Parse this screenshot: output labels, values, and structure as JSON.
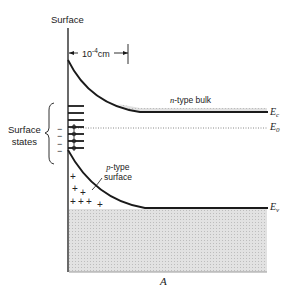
{
  "diagram": {
    "title": "A",
    "axis_label": "Surface",
    "scale_label": {
      "base": "10",
      "exponent": "-4",
      "unit": "cm"
    },
    "region_labels": {
      "n_bulk_italic": "n",
      "n_bulk_rest": "-type bulk",
      "p_surface_italic": "p",
      "p_surface_line1_rest": "-type",
      "p_surface_line2": "surface"
    },
    "surface_states_label": [
      "Surface",
      "states"
    ],
    "energy_levels": [
      {
        "symbol": "E",
        "subscript": "c",
        "name": "conduction band edge"
      },
      {
        "symbol": "E",
        "subscript": "0",
        "name": "reference level"
      },
      {
        "symbol": "E",
        "subscript": "v",
        "name": "valence band edge"
      }
    ],
    "surface_state_charges": [
      "−",
      "−",
      "−",
      "−"
    ],
    "space_charges": [
      "+",
      "+",
      "+",
      "+",
      "+",
      "+",
      "+",
      "+"
    ]
  },
  "colors": {
    "line": "#1a1a1a",
    "shade": "#d9d9d9",
    "dotted": "#888888",
    "text": "#222222"
  }
}
